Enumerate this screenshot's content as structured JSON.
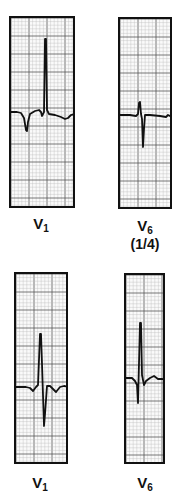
{
  "figure": {
    "colors": {
      "grid_minor": "#bdbdbd",
      "grid_major": "#555555",
      "trace": "#111111",
      "border": "#111111"
    },
    "panels": [
      {
        "id": "top-v1",
        "lead": "V",
        "lead_sub": "1",
        "note": "",
        "box": {
          "x": 9,
          "y": 16,
          "w": 66,
          "h": 192
        },
        "trace": "M0,94 L6,94 L10,95 L13,100 L15,112 L16,113 L17,104 L19,96 L24,93 L28,92 L30,94 L31,98 L33,94 L34,21 L35,21 L36,92 L38,96 L44,97 L50,99 L54,101 L57,100 L60,97 L64,96 L66,96"
      },
      {
        "id": "top-v6",
        "lead": "V",
        "lead_sub": "6",
        "note": "(1/4)",
        "box": {
          "x": 118,
          "y": 17,
          "w": 54,
          "h": 192
        },
        "trace": "M0,96 L10,96 L16,97 L18,95 L19,84 L20,83 L21,95 L22,100 L23,128 L24,110 L25,96 L30,96 L40,97 L46,98 L48,96 L50,97 L54,97"
      },
      {
        "id": "bottom-v1",
        "lead": "V",
        "lead_sub": "1",
        "note": "",
        "box": {
          "x": 14,
          "y": 272,
          "w": 54,
          "h": 192
        },
        "trace": "M0,113 L10,113 L14,114 L17,117 L20,113 L22,111 L24,60 L25,60 L26,90 L28,152 L29,140 L31,112 L34,112 L37,115 L40,118 L44,113 L48,112 L54,113"
      },
      {
        "id": "bottom-v6",
        "lead": "V",
        "lead_sub": "6",
        "note": "",
        "box": {
          "x": 124,
          "y": 273,
          "w": 41,
          "h": 191
        },
        "trace": "M0,103 L6,103 L9,106 L11,110 L12,128 L14,48 L15,48 L16,100 L18,110 L20,106 L24,103 L28,101 L32,104 L36,104 L41,105"
      }
    ],
    "labels": [
      {
        "panel": "top-v1",
        "x": 26,
        "y": 216,
        "w": 40
      },
      {
        "panel": "top-v6",
        "x": 125,
        "y": 218,
        "w": 40
      },
      {
        "panel": "bottom-v1",
        "x": 21,
        "y": 472,
        "w": 40
      },
      {
        "panel": "bottom-v6",
        "x": 124,
        "y": 472,
        "w": 40
      }
    ],
    "note_position": {
      "x": 118,
      "y": 234,
      "w": 54
    }
  }
}
